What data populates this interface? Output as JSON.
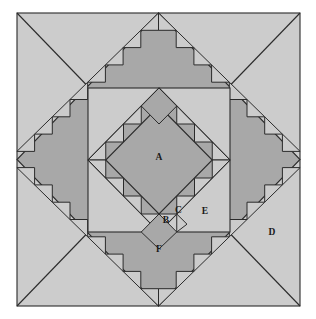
{
  "figure": {
    "type": "diagram",
    "background_color": "#ffffff",
    "canvas": {
      "width": 316,
      "height": 319
    }
  },
  "colors": {
    "light_gray": "#cccccc",
    "medium_gray": "#a8a8a8",
    "dark_gray": "#9c9c9c",
    "outline": "#2b2b2b",
    "label_text": "#1a1a1a",
    "page_background": "#ffffff"
  },
  "geometry": {
    "outer_square": {
      "x": 17,
      "y": 13,
      "width": 283,
      "height": 293
    },
    "inner_square": {
      "x": 88,
      "y": 88,
      "width": 142,
      "height": 144
    },
    "center_diamond_label_point": {
      "x": 159,
      "y": 158
    },
    "grid_step": 17.75
  },
  "labels": [
    {
      "id": "A",
      "text": "A",
      "x": 159,
      "y": 158,
      "region": "center-diamond"
    },
    {
      "id": "B",
      "text": "B",
      "x": 166,
      "y": 220,
      "region": "small-square-bottom"
    },
    {
      "id": "C",
      "text": "C",
      "x": 178,
      "y": 212,
      "region": "small-triangle-bottom"
    },
    {
      "id": "D",
      "text": "D",
      "x": 272,
      "y": 233,
      "region": "outer-corner-right"
    },
    {
      "id": "E",
      "text": "E",
      "x": 205,
      "y": 212,
      "region": "inner-square-field"
    },
    {
      "id": "F",
      "text": "F",
      "x": 159,
      "y": 250,
      "region": "bottom-band"
    }
  ],
  "legend_note": "Labeled regions A through F identify distinct patch shapes within the pieced block."
}
